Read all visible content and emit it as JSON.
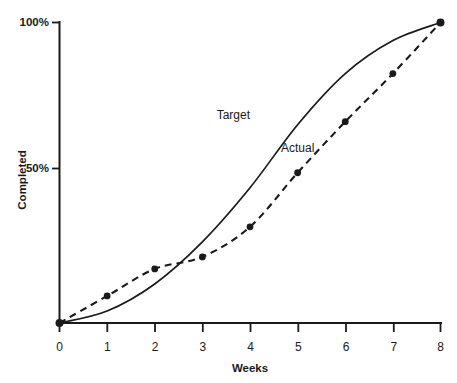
{
  "chart_data": {
    "type": "line",
    "title": "",
    "xlabel": "Weeks",
    "ylabel": "Completed",
    "xlim": [
      0,
      8
    ],
    "ylim": [
      0,
      100
    ],
    "grid": false,
    "legend_position": "inline-annotation",
    "x_tick_labels": [
      "0",
      "1",
      "2",
      "3",
      "4",
      "5",
      "6",
      "7",
      "8"
    ],
    "x_ticks": [
      0,
      1,
      2,
      3,
      4,
      5,
      6,
      7,
      8
    ],
    "y_tick_labels": [
      "50%",
      "100%"
    ],
    "y_ticks": [
      50,
      100
    ],
    "x": [
      0,
      1,
      2,
      3,
      4,
      5,
      6,
      7,
      8
    ],
    "series": [
      {
        "name": "Target",
        "style": "solid",
        "markers": false,
        "color": "#1a1a1a",
        "label_x": 3.3,
        "label_y": 68,
        "values": [
          0,
          4,
          13,
          27,
          45,
          66,
          83,
          94,
          100
        ]
      },
      {
        "name": "Actual",
        "style": "dashed",
        "markers": true,
        "color": "#1a1a1a",
        "label_x": 4.65,
        "label_y": 57,
        "values": [
          0,
          9,
          18,
          22,
          32,
          50,
          67,
          83,
          100
        ]
      }
    ],
    "annotations": [
      {
        "text": "Target",
        "x": 3.3,
        "y": 68
      },
      {
        "text": "Actual",
        "x": 4.65,
        "y": 57
      }
    ]
  },
  "axes": {
    "x_title": "Weeks",
    "y_title": "Completed",
    "y_label_top": "100%",
    "y_label_mid": "50%",
    "tick_0": "0",
    "tick_1": "1",
    "tick_2": "2",
    "tick_3": "3",
    "tick_4": "4",
    "tick_5": "5",
    "tick_6": "6",
    "tick_7": "7",
    "tick_8": "8"
  },
  "labels": {
    "target": "Target",
    "actual": "Actual"
  },
  "colors": {
    "ink": "#1a1a1a",
    "background": "#ffffff"
  }
}
